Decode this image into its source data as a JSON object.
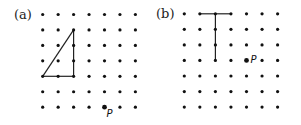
{
  "panels": [
    {
      "label": "(a)",
      "origin": [
        42.7,
        14.5
      ],
      "spacing": 15.45,
      "cols": 7,
      "rows": 7,
      "shape": "triangle",
      "segments": [
        [
          [
            0,
            4
          ],
          [
            2,
            1
          ]
        ],
        [
          [
            2,
            1
          ],
          [
            2,
            4
          ]
        ],
        [
          [
            0,
            4
          ],
          [
            2,
            4
          ]
        ]
      ],
      "point_P": {
        "label": "P",
        "col": 4,
        "row": 6
      }
    },
    {
      "label": "(b)",
      "origin": [
        184.3,
        13.8
      ],
      "spacing": 15.55,
      "cols": 7,
      "rows": 7,
      "shape": "T",
      "segments": [
        [
          [
            1,
            0
          ],
          [
            3,
            0
          ]
        ],
        [
          [
            2,
            0
          ],
          [
            2,
            3
          ]
        ]
      ],
      "point_P": {
        "label": "P",
        "col": 4,
        "row": 3
      }
    }
  ],
  "colors": {
    "dot": "#111111",
    "line": "#222222"
  }
}
